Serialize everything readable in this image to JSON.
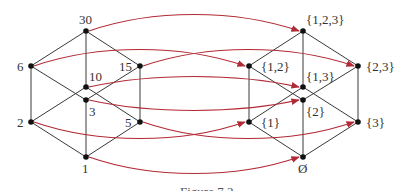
{
  "figure": {
    "caption": "Figure 7.2",
    "colors": {
      "arrow": "#b22a35",
      "edge": "#3a3a3a",
      "node": "#111111",
      "text": "#333333"
    },
    "left_lattice": {
      "description": "Divisors of 30 ordered by divisibility",
      "nodes": [
        {
          "id": "30",
          "label": "30",
          "x": 86,
          "y": 31,
          "lx": 79,
          "ly": 24
        },
        {
          "id": "6",
          "label": "6",
          "x": 31,
          "y": 66,
          "lx": 17,
          "ly": 71
        },
        {
          "id": "15",
          "label": "15",
          "x": 140,
          "y": 66,
          "lx": 119,
          "ly": 71
        },
        {
          "id": "10",
          "label": "10",
          "x": 86,
          "y": 87,
          "lx": 89,
          "ly": 81
        },
        {
          "id": "3",
          "label": "3",
          "x": 86,
          "y": 100,
          "lx": 89,
          "ly": 116
        },
        {
          "id": "2",
          "label": "2",
          "x": 31,
          "y": 122,
          "lx": 17,
          "ly": 127
        },
        {
          "id": "5",
          "label": "5",
          "x": 140,
          "y": 122,
          "lx": 125,
          "ly": 127
        },
        {
          "id": "1",
          "label": "1",
          "x": 86,
          "y": 157,
          "lx": 82,
          "ly": 173
        }
      ],
      "edges": [
        [
          "30",
          "6"
        ],
        [
          "30",
          "15"
        ],
        [
          "30",
          "10"
        ],
        [
          "6",
          "2"
        ],
        [
          "6",
          "3"
        ],
        [
          "15",
          "3"
        ],
        [
          "15",
          "5"
        ],
        [
          "10",
          "2"
        ],
        [
          "10",
          "5"
        ],
        [
          "2",
          "1"
        ],
        [
          "3",
          "1"
        ],
        [
          "5",
          "1"
        ]
      ]
    },
    "right_lattice": {
      "description": "Subsets of {1,2,3} ordered by inclusion",
      "nodes": [
        {
          "id": "123",
          "label": "{1,2,3}",
          "x": 303,
          "y": 31,
          "lx": 306,
          "ly": 24
        },
        {
          "id": "12",
          "label": "{1,2}",
          "x": 249,
          "y": 66,
          "lx": 261,
          "ly": 71
        },
        {
          "id": "23",
          "label": "{2,3}",
          "x": 358,
          "y": 66,
          "lx": 366,
          "ly": 71
        },
        {
          "id": "13",
          "label": "{1,3}",
          "x": 303,
          "y": 87,
          "lx": 306,
          "ly": 81
        },
        {
          "id": "2s",
          "label": "{2}",
          "x": 303,
          "y": 100,
          "lx": 306,
          "ly": 116
        },
        {
          "id": "1s",
          "label": "{1}",
          "x": 249,
          "y": 122,
          "lx": 261,
          "ly": 127
        },
        {
          "id": "3s",
          "label": "{3}",
          "x": 358,
          "y": 122,
          "lx": 366,
          "ly": 127
        },
        {
          "id": "empty",
          "label": "Ø",
          "x": 303,
          "y": 157,
          "lx": 298,
          "ly": 173
        }
      ],
      "edges": [
        [
          "123",
          "12"
        ],
        [
          "123",
          "23"
        ],
        [
          "123",
          "13"
        ],
        [
          "12",
          "1s"
        ],
        [
          "12",
          "2s"
        ],
        [
          "23",
          "2s"
        ],
        [
          "23",
          "3s"
        ],
        [
          "13",
          "1s"
        ],
        [
          "13",
          "3s"
        ],
        [
          "1s",
          "empty"
        ],
        [
          "2s",
          "empty"
        ],
        [
          "3s",
          "empty"
        ]
      ]
    },
    "mapping": [
      {
        "from": "30",
        "to": "123",
        "bend": -22
      },
      {
        "from": "6",
        "to": "12",
        "bend": -22
      },
      {
        "from": "15",
        "to": "23",
        "bend": -22
      },
      {
        "from": "10",
        "to": "13",
        "bend": -14
      },
      {
        "from": "3",
        "to": "2s",
        "bend": 14
      },
      {
        "from": "2",
        "to": "1s",
        "bend": 22
      },
      {
        "from": "5",
        "to": "3s",
        "bend": 22
      },
      {
        "from": "1",
        "to": "empty",
        "bend": 22
      }
    ]
  }
}
